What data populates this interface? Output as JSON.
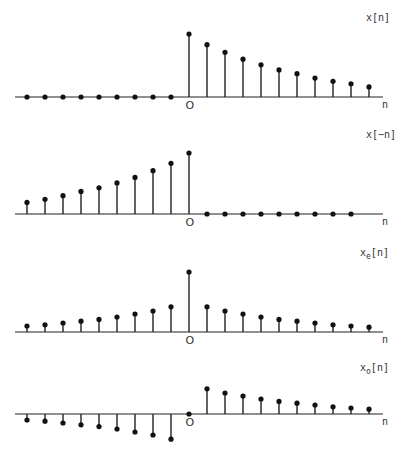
{
  "figure": {
    "panels": [
      {
        "id": "x",
        "label": "x[n]",
        "label_main": "x",
        "label_sub": "",
        "label_arg": "[n]",
        "axis_label": "n",
        "origin_label": "O"
      },
      {
        "id": "x_reflected",
        "label": "x[−n]",
        "label_main": "x",
        "label_sub": "",
        "label_arg": "[−n]",
        "axis_label": "n",
        "origin_label": "O"
      },
      {
        "id": "x_even",
        "label": "x_e[n]",
        "label_main": "x",
        "label_sub": "e",
        "label_arg": "[n]",
        "axis_label": "n",
        "origin_label": "O"
      },
      {
        "id": "x_odd",
        "label": "x_o[n]",
        "label_main": "x",
        "label_sub": "o",
        "label_arg": "[n]",
        "axis_label": "n",
        "origin_label": "O"
      }
    ]
  },
  "chart_data": [
    {
      "type": "stem",
      "title": "x[n]",
      "xlabel": "n",
      "n": [
        -9,
        -8,
        -7,
        -6,
        -5,
        -4,
        -3,
        -2,
        -1,
        0,
        1,
        2,
        3,
        4,
        5,
        6,
        7,
        8,
        9,
        10
      ],
      "values": [
        0,
        0,
        0,
        0,
        0,
        0,
        0,
        0,
        0,
        1.0,
        0.83,
        0.71,
        0.6,
        0.51,
        0.43,
        0.37,
        0.3,
        0.25,
        0.21,
        0.16
      ],
      "ylim": [
        0,
        1.0
      ]
    },
    {
      "type": "stem",
      "title": "x[−n]",
      "xlabel": "n",
      "n": [
        -9,
        -8,
        -7,
        -6,
        -5,
        -4,
        -3,
        -2,
        -1,
        0,
        1,
        2,
        3,
        4,
        5,
        6,
        7,
        8,
        9,
        10
      ],
      "values": [
        0.19,
        0.24,
        0.3,
        0.37,
        0.43,
        0.51,
        0.6,
        0.71,
        0.83,
        1.0,
        0,
        0,
        0,
        0,
        0,
        0,
        0,
        0,
        0,
        0
      ],
      "ylim": [
        0,
        1.0
      ]
    },
    {
      "type": "stem",
      "title": "x_e[n]",
      "xlabel": "n",
      "n": [
        -9,
        -8,
        -7,
        -6,
        -5,
        -4,
        -3,
        -2,
        -1,
        0,
        1,
        2,
        3,
        4,
        5,
        6,
        7,
        8,
        9,
        10
      ],
      "values": [
        0.1,
        0.12,
        0.15,
        0.18,
        0.21,
        0.25,
        0.3,
        0.35,
        0.42,
        1.0,
        0.42,
        0.35,
        0.3,
        0.25,
        0.21,
        0.18,
        0.15,
        0.12,
        0.1,
        0.08
      ],
      "ylim": [
        0,
        1.0
      ]
    },
    {
      "type": "stem",
      "title": "x_o[n]",
      "xlabel": "n",
      "n": [
        -9,
        -8,
        -7,
        -6,
        -5,
        -4,
        -3,
        -2,
        -1,
        0,
        1,
        2,
        3,
        4,
        5,
        6,
        7,
        8,
        9,
        10
      ],
      "values": [
        -0.1,
        -0.12,
        -0.15,
        -0.18,
        -0.21,
        -0.25,
        -0.3,
        -0.35,
        -0.42,
        0,
        0.42,
        0.35,
        0.3,
        0.25,
        0.21,
        0.18,
        0.15,
        0.12,
        0.1,
        0.08
      ],
      "ylim": [
        -0.5,
        0.5
      ]
    }
  ],
  "layout": {
    "x_origin": 189,
    "x_step": 18.0,
    "axis_x_start": 15,
    "axis_x_end": 383,
    "axes_y": [
      97,
      214,
      332,
      414
    ],
    "scales": [
      63,
      61,
      60,
      60
    ],
    "label_y": [
      21,
      138,
      256,
      371
    ],
    "stroke": "#222222"
  }
}
